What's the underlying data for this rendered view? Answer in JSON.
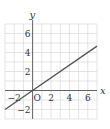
{
  "chart_data": {
    "type": "line",
    "title": "",
    "xlabel": "x",
    "ylabel": "y",
    "xlim": [
      -3,
      7
    ],
    "ylim": [
      -3,
      7
    ],
    "grid": true,
    "x_ticks": [
      -2,
      2,
      4,
      6
    ],
    "y_ticks": [
      6,
      4,
      2,
      -2
    ],
    "origin_label": "O",
    "series": [
      {
        "name": "line",
        "equation": "y = (2/3)x",
        "x": [
          -3,
          7
        ],
        "y": [
          -2,
          4.67
        ]
      }
    ],
    "colors": {
      "line": "#555555",
      "grid": "#d8d8d8",
      "axis": "#444444"
    }
  }
}
